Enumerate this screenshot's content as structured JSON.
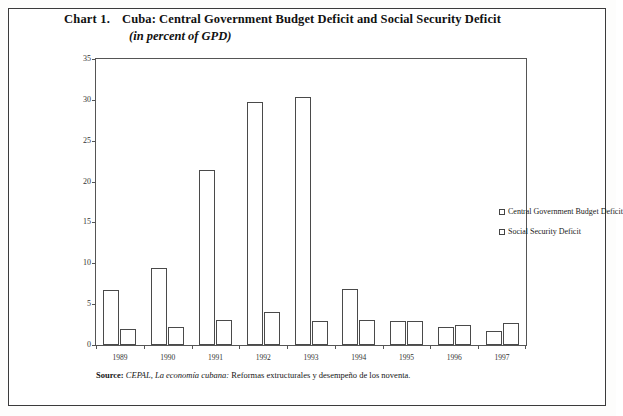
{
  "title": {
    "number": "Chart 1.",
    "main": "Cuba: Central Government Budget Deficit and Social Security Deficit",
    "subtitle": "(in percent of GPD)"
  },
  "source": {
    "label": "Source:",
    "publisher": "CEPAL,",
    "work": "La economía cubana:",
    "rest": "Reformas extructurales y desempeño de los noventa."
  },
  "legend": {
    "items": [
      {
        "label": "Central Government Budget Deficit",
        "marker": "open-square"
      },
      {
        "label": "Social Security Deficit",
        "marker": "open-square"
      }
    ]
  },
  "axis": {
    "y_ticks": [
      "0",
      "5",
      "10",
      "15",
      "20",
      "25",
      "30",
      "35"
    ]
  },
  "chart_data": {
    "type": "bar",
    "title": "Cuba: Central Government Budget Deficit and Social Security Deficit",
    "subtitle": "(in percent of GPD)",
    "xlabel": "",
    "ylabel": "",
    "ylim": [
      0,
      35
    ],
    "ytick_step": 5,
    "grid": false,
    "legend_position": "inside-upper-right",
    "categories": [
      "1989",
      "1990",
      "1991",
      "1992",
      "1993",
      "1994",
      "1995",
      "1996",
      "1997"
    ],
    "series": [
      {
        "name": "Central Government Budget Deficit",
        "values": [
          6.7,
          9.4,
          21.4,
          29.8,
          30.4,
          6.8,
          2.9,
          2.2,
          1.7
        ],
        "fill": "#ffffff",
        "edge": "#4a4a4a"
      },
      {
        "name": "Social Security Deficit",
        "values": [
          1.9,
          2.2,
          3.1,
          4.1,
          3.0,
          3.1,
          2.9,
          2.5,
          2.7
        ],
        "fill": "#ffffff",
        "edge": "#4a4a4a"
      }
    ]
  }
}
